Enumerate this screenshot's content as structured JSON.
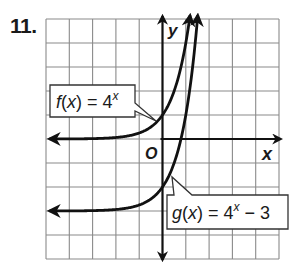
{
  "problem": {
    "number": "11."
  },
  "graph": {
    "x_axis_label": "x",
    "y_axis_label": "y",
    "origin_label": "O",
    "grid": {
      "x_range": [
        -5,
        5
      ],
      "y_range": [
        -5,
        5
      ],
      "step": 1
    },
    "colors": {
      "grid": "#8a8a8a",
      "axis": "#111111",
      "curve": "#111111",
      "box_border": "#333333"
    }
  },
  "functions": [
    {
      "id": "f",
      "name": "f(x)",
      "expression": "4",
      "exponent": "x",
      "suffix": "",
      "asymptote": 0
    },
    {
      "id": "g",
      "name": "g(x)",
      "expression": "4",
      "exponent": "x",
      "suffix": " − 3",
      "asymptote": -3
    }
  ],
  "chart_data": {
    "type": "line",
    "title": "",
    "xlabel": "x",
    "ylabel": "y",
    "xlim": [
      -5,
      5
    ],
    "ylim": [
      -5,
      5
    ],
    "grid": true,
    "series": [
      {
        "name": "f(x) = 4^x",
        "x": [
          -5,
          -3,
          -2,
          -1,
          0,
          0.5,
          1,
          1.16
        ],
        "values": [
          0.001,
          0.016,
          0.0625,
          0.25,
          1,
          2,
          4,
          5
        ]
      },
      {
        "name": "g(x) = 4^x − 3",
        "x": [
          -5,
          -3,
          -2,
          -1,
          0,
          0.5,
          1,
          1.5
        ],
        "values": [
          -2.999,
          -2.984,
          -2.9375,
          -2.75,
          -2,
          -1,
          1,
          5
        ]
      }
    ],
    "annotations": [
      "f(x) = 4^x",
      "g(x) = 4^x − 3",
      "O"
    ]
  }
}
